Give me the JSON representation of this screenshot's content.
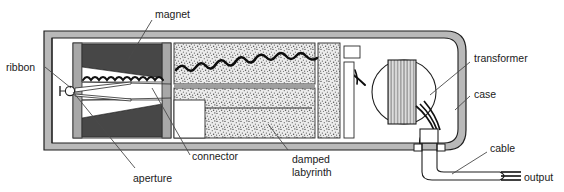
{
  "figure": {
    "background": "#ffffff",
    "ink": "#1a1a1a"
  },
  "labels": {
    "magnet": "magnet",
    "ribbon": "ribbon",
    "aperture": "aperture",
    "connector": "connector",
    "damped_line1": "damped",
    "damped_line2": "labyrinth",
    "transformer": "transformer",
    "case": "case",
    "cable": "cable",
    "output": "output"
  },
  "parts": {
    "case": {
      "name": "case",
      "fill": "#b9b9b9",
      "stroke": "#1f1f1f"
    },
    "magnet": {
      "name": "magnet",
      "fill": "#4a4a4a"
    },
    "pole_piece": {
      "name": "pole-piece",
      "fill": "#a8a8a8"
    },
    "ribbon": {
      "name": "ribbon",
      "stroke": "#111111"
    },
    "aperture": {
      "name": "aperture",
      "stroke": "#222222"
    },
    "damped_labyrinth": {
      "name": "damped-labyrinth",
      "fill": "#d8d8d8",
      "texture": "stipple"
    },
    "connector": {
      "name": "connector",
      "fill": "#ffffff"
    },
    "transformer": {
      "name": "transformer",
      "coil_fill": "#d6d6d6",
      "stroke": "#1f1f1f"
    },
    "cable": {
      "name": "cable",
      "stroke": "#1f1f1f"
    },
    "output_leads": {
      "name": "output-leads",
      "count": 3
    }
  }
}
